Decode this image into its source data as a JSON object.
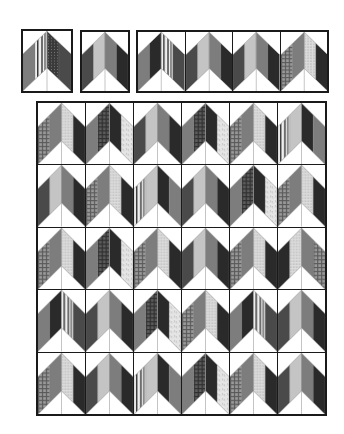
{
  "colors": {
    "outline": "#1a1a1a",
    "background": "#ffffff",
    "dark": "#262626",
    "mid": "#7a7a7a",
    "light": "#c8c8c8",
    "white": "#ffffff"
  },
  "fabrics": {
    "dark": {
      "base": "#2a2a2a",
      "pattern": "none"
    },
    "darkgray": {
      "base": "#4a4a4a",
      "pattern": "none"
    },
    "mid": {
      "base": "#7d7d7d",
      "pattern": "none"
    },
    "light": {
      "base": "#c4c4c4",
      "pattern": "none"
    },
    "plaid": {
      "base": "#8a8a8a",
      "pattern": "plaid"
    },
    "darkplaid": {
      "base": "#555555",
      "pattern": "plaid"
    },
    "dots": {
      "base": "#d8d8d8",
      "pattern": "dots"
    },
    "paisley": {
      "base": "#e4e4e4",
      "pattern": "paisley"
    },
    "stripe": {
      "base": "#ececec",
      "pattern": "stripe"
    },
    "darkdots": {
      "base": "#3a3a3a",
      "pattern": "darkdots"
    }
  },
  "top_blocks": [
    {
      "strips": [
        "mid",
        "stripe",
        "darkdots",
        "darkgray"
      ]
    },
    {
      "strips": [
        "darkgray",
        "light",
        "mid",
        "dark"
      ]
    }
  ],
  "top_strip": [
    {
      "strips": [
        "mid",
        "dark",
        "stripe",
        "darkgray"
      ]
    },
    {
      "strips": [
        "darkgray",
        "light",
        "mid",
        "dark"
      ]
    },
    {
      "strips": [
        "darkgray",
        "light",
        "mid",
        "dark"
      ]
    },
    {
      "strips": [
        "plaid",
        "mid",
        "dots",
        "dark"
      ]
    }
  ],
  "grid": {
    "rows": 5,
    "cols": 6,
    "blocks": [
      [
        {
          "strips": [
            "plaid",
            "mid",
            "dots",
            "dark"
          ]
        },
        {
          "strips": [
            "mid",
            "darkplaid",
            "dark",
            "paisley"
          ]
        },
        {
          "strips": [
            "darkgray",
            "light",
            "mid",
            "dark"
          ]
        },
        {
          "strips": [
            "mid",
            "darkplaid",
            "dark",
            "paisley"
          ]
        },
        {
          "strips": [
            "plaid",
            "mid",
            "dots",
            "dark"
          ]
        },
        {
          "strips": [
            "stripe",
            "light",
            "dark",
            "mid"
          ]
        }
      ],
      [
        {
          "strips": [
            "darkgray",
            "light",
            "mid",
            "dark"
          ]
        },
        {
          "strips": [
            "plaid",
            "mid",
            "dots",
            "dark"
          ]
        },
        {
          "strips": [
            "stripe",
            "light",
            "dark",
            "mid"
          ]
        },
        {
          "strips": [
            "darkgray",
            "light",
            "mid",
            "dark"
          ]
        },
        {
          "strips": [
            "mid",
            "darkplaid",
            "dark",
            "paisley"
          ]
        },
        {
          "strips": [
            "plaid",
            "mid",
            "dots",
            "dark"
          ]
        }
      ],
      [
        {
          "strips": [
            "plaid",
            "mid",
            "dots",
            "dark"
          ]
        },
        {
          "strips": [
            "mid",
            "darkplaid",
            "dark",
            "paisley"
          ]
        },
        {
          "strips": [
            "plaid",
            "mid",
            "dots",
            "dark"
          ]
        },
        {
          "strips": [
            "darkgray",
            "light",
            "mid",
            "dark"
          ]
        },
        {
          "strips": [
            "plaid",
            "mid",
            "dots",
            "dark"
          ]
        },
        {
          "strips": [
            "dark",
            "dots",
            "mid",
            "plaid"
          ]
        }
      ],
      [
        {
          "strips": [
            "mid",
            "dark",
            "stripe",
            "darkgray"
          ]
        },
        {
          "strips": [
            "darkgray",
            "light",
            "mid",
            "dark"
          ]
        },
        {
          "strips": [
            "mid",
            "darkplaid",
            "dark",
            "paisley"
          ]
        },
        {
          "strips": [
            "plaid",
            "mid",
            "dots",
            "dark"
          ]
        },
        {
          "strips": [
            "mid",
            "dark",
            "stripe",
            "darkgray"
          ]
        },
        {
          "strips": [
            "darkgray",
            "light",
            "mid",
            "dark"
          ]
        }
      ],
      [
        {
          "strips": [
            "plaid",
            "mid",
            "dots",
            "dark"
          ]
        },
        {
          "strips": [
            "darkgray",
            "light",
            "mid",
            "dark"
          ]
        },
        {
          "strips": [
            "stripe",
            "light",
            "dark",
            "mid"
          ]
        },
        {
          "strips": [
            "mid",
            "darkplaid",
            "dark",
            "paisley"
          ]
        },
        {
          "strips": [
            "plaid",
            "mid",
            "dots",
            "dark"
          ]
        },
        {
          "strips": [
            "darkgray",
            "light",
            "mid",
            "dark"
          ]
        }
      ]
    ]
  }
}
